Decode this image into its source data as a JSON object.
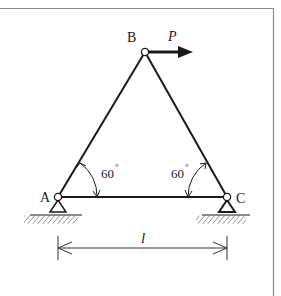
{
  "diagram": {
    "type": "truss",
    "nodes": {
      "A": {
        "label": "A",
        "support": "pin"
      },
      "B": {
        "label": "B",
        "support": "none"
      },
      "C": {
        "label": "C",
        "support": "roller"
      }
    },
    "members": [
      [
        "A",
        "B"
      ],
      [
        "B",
        "C"
      ],
      [
        "A",
        "C"
      ]
    ],
    "load": {
      "label": "P",
      "at": "B",
      "direction": "right"
    },
    "angles": [
      {
        "at": "A",
        "value": "60",
        "unit": "°"
      },
      {
        "at": "C",
        "value": "60",
        "unit": "°"
      }
    ],
    "dimension": {
      "label": "l",
      "from": "A",
      "to": "C"
    },
    "colors": {
      "line": "#1a1a1a",
      "frame": "#888888",
      "background": "#ffffff"
    }
  }
}
